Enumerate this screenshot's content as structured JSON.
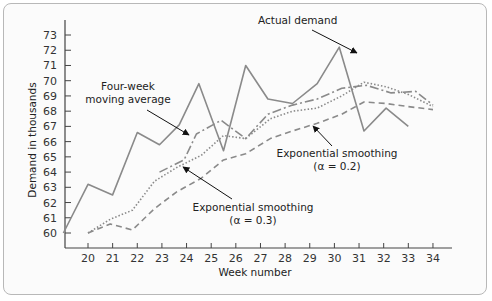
{
  "chart_data": {
    "type": "line",
    "title": "",
    "xlabel": "Week number",
    "ylabel": "Demand in thousands",
    "xlim": [
      19,
      34.7
    ],
    "ylim": [
      59.3,
      73.7
    ],
    "x_ticks": [
      20,
      21,
      22,
      23,
      24,
      25,
      26,
      27,
      28,
      29,
      30,
      31,
      32,
      33,
      34
    ],
    "y_ticks": [
      60,
      61,
      62,
      63,
      64,
      65,
      66,
      67,
      68,
      69,
      70,
      71,
      72,
      73
    ],
    "grid": false,
    "series": [
      {
        "name": "Actual demand",
        "style": "solid",
        "x": [
          19.0,
          20.0,
          21.0,
          22.0,
          22.9,
          23.7,
          24.5,
          25.5,
          26.4,
          27.3,
          28.3,
          29.3,
          30.2,
          31.2,
          32.1,
          33.0
        ],
        "values": [
          60.0,
          63.2,
          62.5,
          66.6,
          65.8,
          67.1,
          69.8,
          65.4,
          71.0,
          68.8,
          68.5,
          69.8,
          72.2,
          66.7,
          68.2,
          67.0
        ]
      },
      {
        "name": "Four-week moving average",
        "style": "dashdot",
        "x": [
          22.9,
          23.9,
          24.4,
          25.4,
          26.4,
          27.3,
          28.3,
          29.3,
          30.3,
          31.3,
          32.3,
          33.3,
          34.0
        ],
        "values": [
          64.0,
          64.8,
          66.5,
          67.4,
          66.2,
          67.8,
          68.4,
          68.8,
          69.5,
          69.7,
          69.2,
          69.3,
          68.4
        ],
        "arrow_at": [
          24.1,
          66.3
        ]
      },
      {
        "name": "Exponential smoothing (α = 0.3)",
        "style": "dotted",
        "x": [
          20.0,
          20.9,
          21.8,
          22.7,
          23.6,
          24.6,
          25.5,
          26.4,
          27.4,
          28.3,
          29.3,
          30.3,
          31.2,
          32.1,
          33.0,
          34.0
        ],
        "values": [
          60.0,
          60.9,
          61.5,
          63.4,
          64.3,
          65.1,
          66.4,
          66.2,
          67.5,
          68.0,
          68.2,
          69.0,
          69.9,
          69.6,
          69.1,
          68.3
        ],
        "arrow_at": [
          23.8,
          64.3
        ]
      },
      {
        "name": "Exponential smoothing (α = 0.2)",
        "style": "dashed",
        "x": [
          20.0,
          20.9,
          21.8,
          22.7,
          23.6,
          24.6,
          25.5,
          26.4,
          27.4,
          28.3,
          29.3,
          30.3,
          31.2,
          32.1,
          33.0,
          34.0
        ],
        "values": [
          60.0,
          60.6,
          60.2,
          61.6,
          62.7,
          63.6,
          64.8,
          65.2,
          66.2,
          66.7,
          67.2,
          67.8,
          68.6,
          68.5,
          68.3,
          68.1
        ],
        "arrow_at": [
          28.4,
          67.2
        ]
      }
    ],
    "annotations": [
      {
        "text": [
          "Actual demand"
        ],
        "points_to": "Actual demand"
      },
      {
        "text": [
          "Four-week",
          "moving average"
        ],
        "points_to": "Four-week moving average"
      },
      {
        "text": [
          "Exponential smoothing",
          "(α = 0.2)"
        ],
        "points_to": "Exponential smoothing (α = 0.2)"
      },
      {
        "text": [
          "Exponential smoothing",
          "(α = 0.3)"
        ],
        "points_to": "Exponential smoothing (α = 0.3)"
      }
    ]
  },
  "labels": {
    "xlabel": "Week number",
    "ylabel": "Demand in thousands",
    "ann_actual": "Actual demand",
    "ann_ma_1": "Four-week",
    "ann_ma_2": "moving average",
    "ann_e2_1": "Exponential smoothing",
    "ann_e2_2": "(α = 0.2)",
    "ann_e3_1": "Exponential smoothing",
    "ann_e3_2": "(α = 0.3)"
  }
}
